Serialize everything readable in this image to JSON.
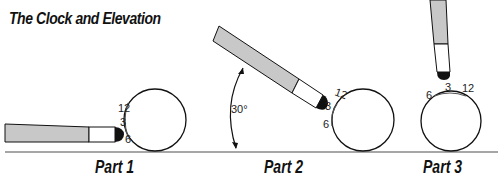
{
  "title": "The Clock and Elevation",
  "colors": {
    "cue_shaft": "#c8c8c8",
    "cue_ferrule": "#ffffff",
    "cue_tip": "#111111",
    "outline": "#111111",
    "table_line": "#888888",
    "ball_fill": "#ffffff"
  },
  "parts": [
    {
      "label": "Part 1",
      "cue_orientation": "horizontal",
      "clock_labels": {
        "top": "12",
        "middle": "3",
        "bottom": "6"
      }
    },
    {
      "label": "Part 2",
      "cue_orientation": "angled",
      "elevation_angle": "30°",
      "clock_labels": {
        "top": "12",
        "middle": "3",
        "bottom": "6"
      }
    },
    {
      "label": "Part 3",
      "cue_orientation": "vertical",
      "clock_labels": {
        "left": "6",
        "middle": "3",
        "right": "12"
      }
    }
  ]
}
